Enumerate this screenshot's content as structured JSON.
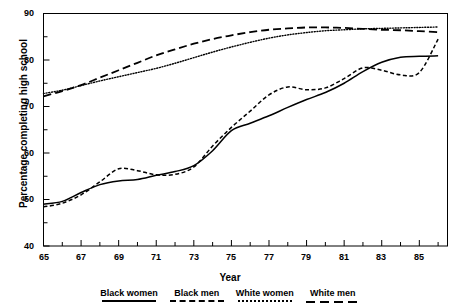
{
  "figure": {
    "title": "",
    "title_visible_fragment": "",
    "background": "#ffffff",
    "line_color": "#000000"
  },
  "axes": {
    "x": {
      "label": "Year",
      "ticks": [
        "65",
        "67",
        "69",
        "71",
        "73",
        "75",
        "77",
        "79",
        "81",
        "83",
        "85"
      ],
      "range": [
        65,
        86.5
      ],
      "minor_tick_step": 1
    },
    "y": {
      "label": "Percentage completing high school",
      "ticks": [
        "40",
        "50",
        "60",
        "70",
        "80",
        "90"
      ],
      "range": [
        40,
        90
      ],
      "minor_ticks": [
        "45",
        "55",
        "65",
        "75",
        "85"
      ]
    }
  },
  "legend": {
    "position": "bottom",
    "entries": [
      {
        "label": "Black women",
        "style": "solid"
      },
      {
        "label": "Black men",
        "style": "dash"
      },
      {
        "label": "White women",
        "style": "dot"
      },
      {
        "label": "White men",
        "style": "longdash"
      }
    ]
  },
  "chart_data": {
    "type": "line",
    "title": "",
    "xlabel": "Year",
    "ylabel": "Percentage completing high school",
    "xlim": [
      65,
      86.5
    ],
    "ylim": [
      40,
      90
    ],
    "grid": false,
    "legend_position": "bottom",
    "x": [
      65,
      66,
      67,
      68,
      69,
      70,
      71,
      72,
      73,
      74,
      75,
      76,
      77,
      78,
      79,
      80,
      81,
      82,
      83,
      84,
      85,
      86
    ],
    "series": [
      {
        "name": "Black women",
        "style": "solid",
        "values": [
          49.0,
          49.6,
          51.5,
          53.2,
          54.0,
          54.3,
          55.2,
          56.0,
          57.3,
          60.5,
          64.8,
          66.4,
          68.0,
          69.8,
          71.5,
          73.0,
          75.0,
          77.5,
          79.5,
          80.6,
          80.8,
          80.9
        ]
      },
      {
        "name": "Black men",
        "style": "dash",
        "values": [
          48.4,
          49.2,
          51.0,
          53.8,
          56.6,
          56.2,
          55.3,
          55.4,
          57.0,
          61.5,
          65.5,
          69.0,
          72.5,
          74.2,
          73.6,
          74.0,
          76.0,
          78.3,
          77.8,
          76.8,
          77.3,
          84.5
        ]
      },
      {
        "name": "White women",
        "style": "dot",
        "values": [
          72.8,
          73.5,
          74.5,
          75.5,
          76.4,
          77.3,
          78.2,
          79.3,
          80.5,
          81.7,
          82.8,
          83.8,
          84.7,
          85.4,
          85.9,
          86.3,
          86.5,
          86.7,
          86.8,
          86.9,
          87.0,
          87.1
        ]
      },
      {
        "name": "White men",
        "style": "longdash",
        "values": [
          72.2,
          73.3,
          74.6,
          76.2,
          77.8,
          79.4,
          81.0,
          82.3,
          83.5,
          84.5,
          85.3,
          86.0,
          86.5,
          86.8,
          87.0,
          87.0,
          86.9,
          86.7,
          86.5,
          86.4,
          86.2,
          86.0
        ]
      }
    ]
  }
}
